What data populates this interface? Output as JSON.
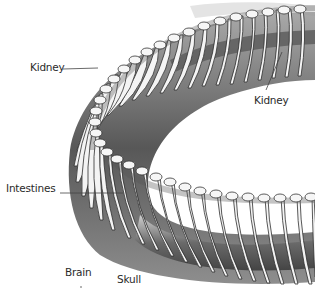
{
  "diagram": {
    "labels": [
      {
        "id": "kidney-left",
        "text": "Kidney"
      },
      {
        "id": "kidney-right",
        "text": "Kidney"
      },
      {
        "id": "intestines",
        "text": "Intestines"
      },
      {
        "id": "brain",
        "text": "Brain"
      },
      {
        "id": "skull",
        "text": "Skull"
      }
    ],
    "colors": {
      "background": "#ffffff",
      "bone": "#f2f2f2",
      "bone_outline": "#3a3a3a",
      "shadow": "#2b2b2b",
      "organ": "#6e6e6e",
      "label_text": "#2a2a2a"
    }
  }
}
